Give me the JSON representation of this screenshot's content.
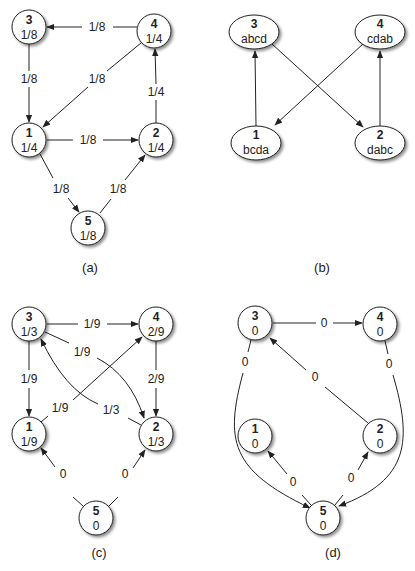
{
  "colors": {
    "stroke": "#222222",
    "fill": "#ffffff",
    "shadow": "#bbbbbb",
    "text": "#222222"
  },
  "panels": [
    {
      "id": "a",
      "caption": "(a)",
      "caption_pos": [
        90,
        268
      ],
      "shape": "circle",
      "nodes": [
        {
          "id": "3",
          "value": "1/8",
          "x": 29,
          "y": 27
        },
        {
          "id": "4",
          "value": "1/4",
          "x": 154,
          "y": 31
        },
        {
          "id": "1",
          "value": "1/4",
          "x": 29,
          "y": 140
        },
        {
          "id": "2",
          "value": "1/4",
          "x": 156,
          "y": 140
        },
        {
          "id": "5",
          "value": "1/8",
          "x": 88,
          "y": 228
        }
      ],
      "edges": [
        {
          "from": "4",
          "to": "3",
          "label": "1/8",
          "label_pos": [
            97,
            27
          ]
        },
        {
          "from": "3",
          "to": "1",
          "label": "1/8",
          "label_pos": [
            29,
            79
          ]
        },
        {
          "from": "4",
          "to": "1",
          "label": "1/8",
          "label_pos": [
            97,
            79
          ]
        },
        {
          "from": "2",
          "to": "4",
          "label": "1/4",
          "label_pos": [
            156,
            92
          ]
        },
        {
          "from": "1",
          "to": "2",
          "label": "1/8",
          "label_pos": [
            88,
            140
          ]
        },
        {
          "from": "1",
          "to": "5",
          "label": "1/8",
          "label_pos": [
            60,
            189
          ]
        },
        {
          "from": "5",
          "to": "2",
          "label": "1/8",
          "label_pos": [
            118,
            189
          ]
        }
      ]
    },
    {
      "id": "b",
      "caption": "(b)",
      "caption_pos": [
        322,
        268
      ],
      "shape": "ellipse",
      "nodes": [
        {
          "id": "3",
          "value": "abcd",
          "x": 254,
          "y": 32
        },
        {
          "id": "4",
          "value": "cdab",
          "x": 380,
          "y": 32
        },
        {
          "id": "1",
          "value": "bcda",
          "x": 256,
          "y": 143
        },
        {
          "id": "2",
          "value": "dabc",
          "x": 380,
          "y": 143
        }
      ],
      "edges": [
        {
          "from": "1",
          "to": "3",
          "label": "",
          "label_pos": [
            0,
            0
          ]
        },
        {
          "from": "2",
          "to": "4",
          "label": "",
          "label_pos": [
            0,
            0
          ]
        },
        {
          "from": "3",
          "to": "2",
          "label": "",
          "label_pos": [
            0,
            0
          ]
        },
        {
          "from": "4",
          "to": "1",
          "label": "",
          "label_pos": [
            0,
            0
          ]
        }
      ]
    },
    {
      "id": "c",
      "caption": "(c)",
      "caption_pos": [
        99,
        553
      ],
      "shape": "circle",
      "nodes": [
        {
          "id": "3",
          "value": "1/3",
          "x": 29,
          "y": 324
        },
        {
          "id": "4",
          "value": "2/9",
          "x": 156,
          "y": 324
        },
        {
          "id": "1",
          "value": "1/9",
          "x": 29,
          "y": 434
        },
        {
          "id": "2",
          "value": "1/3",
          "x": 156,
          "y": 434
        },
        {
          "id": "5",
          "value": "0",
          "x": 96,
          "y": 518
        }
      ],
      "edges": [
        {
          "from": "3",
          "to": "4",
          "label": "1/9",
          "label_pos": [
            92,
            324
          ]
        },
        {
          "from": "3",
          "to": "1",
          "label": "1/9",
          "label_pos": [
            29,
            379
          ]
        },
        {
          "from": "3",
          "to": "2",
          "label": "1/9",
          "label_pos": [
            82,
            352
          ]
        },
        {
          "from": "4",
          "to": "2",
          "label": "2/9",
          "label_pos": [
            156,
            379
          ]
        },
        {
          "from": "1",
          "to": "4",
          "label": "1/9",
          "label_pos": [
            60,
            408
          ]
        },
        {
          "from": "2",
          "to": "3",
          "label": "1/3",
          "label_pos": [
            111,
            410
          ]
        },
        {
          "from": "5",
          "to": "1",
          "label": "0",
          "label_pos": [
            62,
            474
          ]
        },
        {
          "from": "5",
          "to": "2",
          "label": "0",
          "label_pos": [
            125,
            474
          ]
        }
      ]
    },
    {
      "id": "d",
      "caption": "(d)",
      "caption_pos": [
        333,
        553
      ],
      "shape": "circle",
      "nodes": [
        {
          "id": "3",
          "value": "0",
          "x": 255,
          "y": 323
        },
        {
          "id": "4",
          "value": "0",
          "x": 380,
          "y": 324
        },
        {
          "id": "1",
          "value": "0",
          "x": 255,
          "y": 436
        },
        {
          "id": "2",
          "value": "0",
          "x": 380,
          "y": 436
        },
        {
          "id": "5",
          "value": "0",
          "x": 323,
          "y": 518
        }
      ],
      "edges": [
        {
          "from": "3",
          "to": "4",
          "label": "0",
          "label_pos": [
            324,
            323
          ]
        },
        {
          "from": "3",
          "to": "5",
          "label": "0",
          "label_pos": [
            245,
            362
          ]
        },
        {
          "from": "4",
          "to": "5",
          "label": "0",
          "label_pos": [
            389,
            364
          ]
        },
        {
          "from": "2",
          "to": "3",
          "label": "0",
          "label_pos": [
            315,
            377
          ]
        },
        {
          "from": "5",
          "to": "1",
          "label": "0",
          "label_pos": [
            293,
            482
          ]
        },
        {
          "from": "5",
          "to": "2",
          "label": "0",
          "label_pos": [
            351,
            478
          ]
        }
      ]
    }
  ]
}
